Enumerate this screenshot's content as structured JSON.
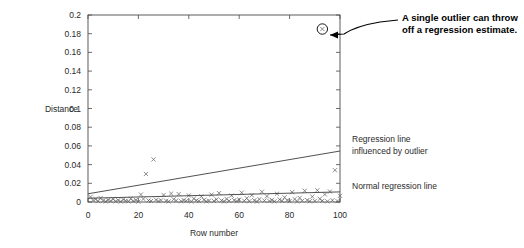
{
  "chart_data": {
    "type": "scatter",
    "title": "",
    "xlabel": "Row number",
    "ylabel": "Distance",
    "xlim": [
      0,
      100
    ],
    "ylim": [
      0,
      0.2
    ],
    "grid": false,
    "legend_position": "right-inline",
    "x_ticks": [
      0,
      20,
      40,
      60,
      80,
      100
    ],
    "x_tick_labels": [
      "0",
      "20",
      "40",
      "60",
      "80",
      "100"
    ],
    "y_ticks": [
      0,
      0.02,
      0.04,
      0.06,
      0.08,
      0.1,
      0.12,
      0.14,
      0.16,
      0.18,
      0.2
    ],
    "y_tick_labels": [
      "0",
      "0.02",
      "0.04",
      "0.06",
      "0.08",
      "0.1",
      "0.12",
      "0.14",
      "0.16",
      "0.18",
      "0.2"
    ],
    "marker": "x",
    "points": [
      [
        1,
        0.0055
      ],
      [
        2,
        0.0018
      ],
      [
        3,
        0.003
      ],
      [
        4,
        0.0009
      ],
      [
        5,
        0.0042
      ],
      [
        6,
        0.0014
      ],
      [
        7,
        0.0006
      ],
      [
        8,
        0.0022
      ],
      [
        9,
        0.0011
      ],
      [
        10,
        0.0031
      ],
      [
        11,
        0.0008
      ],
      [
        12,
        0.0019
      ],
      [
        13,
        0.0005
      ],
      [
        14,
        0.0026
      ],
      [
        15,
        0.0013
      ],
      [
        16,
        0.0007
      ],
      [
        17,
        0.0035
      ],
      [
        18,
        0.001
      ],
      [
        19,
        0.0021
      ],
      [
        20,
        0.0004
      ],
      [
        21,
        0.008
      ],
      [
        22,
        0.0032
      ],
      [
        23,
        0.03
      ],
      [
        24,
        0.0016
      ],
      [
        25,
        0.0011
      ],
      [
        26,
        0.0455
      ],
      [
        27,
        0.0024
      ],
      [
        28,
        0.0009
      ],
      [
        29,
        0.0018
      ],
      [
        30,
        0.0075
      ],
      [
        31,
        0.0013
      ],
      [
        32,
        0.0006
      ],
      [
        33,
        0.009
      ],
      [
        34,
        0.0029
      ],
      [
        35,
        0.0015
      ],
      [
        36,
        0.0085
      ],
      [
        37,
        0.0008
      ],
      [
        38,
        0.002
      ],
      [
        39,
        0.0012
      ],
      [
        40,
        0.007
      ],
      [
        41,
        0.0005
      ],
      [
        42,
        0.0036
      ],
      [
        43,
        0.0017
      ],
      [
        44,
        0.001
      ],
      [
        45,
        0.006
      ],
      [
        46,
        0.0023
      ],
      [
        47,
        0.0007
      ],
      [
        48,
        0.0014
      ],
      [
        49,
        0.0078
      ],
      [
        50,
        0.0011
      ],
      [
        51,
        0.0028
      ],
      [
        52,
        0.0095
      ],
      [
        53,
        0.0016
      ],
      [
        54,
        0.0006
      ],
      [
        55,
        0.0033
      ],
      [
        56,
        0.0012
      ],
      [
        57,
        0.0068
      ],
      [
        58,
        0.0019
      ],
      [
        59,
        0.0009
      ],
      [
        60,
        0.0025
      ],
      [
        61,
        0.01
      ],
      [
        62,
        0.0013
      ],
      [
        63,
        0.004
      ],
      [
        64,
        0.0008
      ],
      [
        65,
        0.0072
      ],
      [
        66,
        0.0018
      ],
      [
        67,
        0.0005
      ],
      [
        68,
        0.003
      ],
      [
        69,
        0.011
      ],
      [
        70,
        0.0015
      ],
      [
        71,
        0.0061
      ],
      [
        72,
        0.001
      ],
      [
        73,
        0.0022
      ],
      [
        74,
        0.0007
      ],
      [
        75,
        0.0088
      ],
      [
        76,
        0.0026
      ],
      [
        77,
        0.0012
      ],
      [
        78,
        0.005
      ],
      [
        79,
        0.0017
      ],
      [
        80,
        0.0009
      ],
      [
        81,
        0.0105
      ],
      [
        82,
        0.0031
      ],
      [
        83,
        0.0006
      ],
      [
        84,
        0.0044
      ],
      [
        85,
        0.0014
      ],
      [
        86,
        0.012
      ],
      [
        87,
        0.002
      ],
      [
        88,
        0.0008
      ],
      [
        89,
        0.0058
      ],
      [
        90,
        0.0011
      ],
      [
        91,
        0.0125
      ],
      [
        92,
        0.0034
      ],
      [
        93,
        0.0013
      ],
      [
        94,
        0.0081
      ],
      [
        95,
        0.0007
      ],
      [
        96,
        0.0112
      ],
      [
        97,
        0.0019
      ],
      [
        98,
        0.034
      ],
      [
        99,
        0.001
      ],
      [
        100,
        0.0066
      ]
    ],
    "outlier_point": {
      "x": 93,
      "y": 0.185,
      "circled": true
    },
    "series": [
      {
        "name": "Regression line influenced by outlier",
        "type": "line",
        "x": [
          0,
          100
        ],
        "values": [
          0.0088,
          0.0545
        ]
      },
      {
        "name": "Normal regression line",
        "type": "line",
        "x": [
          0,
          100
        ],
        "values": [
          0.004,
          0.0108
        ]
      }
    ],
    "annotations": [
      {
        "name": "outlier-callout",
        "text_line_1": "A single outlier can throw",
        "text_line_2": "off a regression estimate.",
        "points_to": {
          "x": 93,
          "y": 0.185
        }
      },
      {
        "name": "influenced-line-label",
        "text_line_1": "Regression line",
        "text_line_2": "influenced by outlier"
      },
      {
        "name": "normal-line-label",
        "text_line_1": "Normal regression line"
      }
    ]
  },
  "colors": {
    "axis": "#4a4a4a",
    "marker": "#5c5c5c",
    "line": "#3d3d3d",
    "callout": "#000000",
    "background": "#ffffff"
  }
}
